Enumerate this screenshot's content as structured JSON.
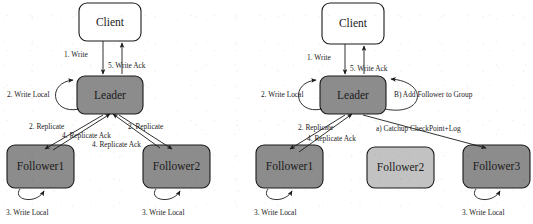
{
  "figure": {
    "background_color": "#ffffff",
    "line_color": "#1a1a1a",
    "text_color": "#1c1c1c",
    "colors": {
      "client_fill": "#ffffff",
      "leader_fill": "#8c8c8c",
      "follower_active_fill": "#8c8c8c",
      "follower_idle_fill": "#c2c2c2"
    }
  },
  "panels": [
    {
      "id": "left-panel",
      "name": "normal-replication-flow",
      "nodes": {
        "client": "Client",
        "leader": "Leader",
        "follower1": "Follower1",
        "follower2": "Follower2"
      },
      "edge_labels": {
        "write": "1. Write",
        "write_ack": "5. Write Ack",
        "leader_write_local": "2. Write Local",
        "replicate_left": "2. Replicate",
        "replicate_right": "2. Replicate",
        "replicate_ack_left": "4. Replicate Ack",
        "replicate_ack_right": "4. Replicate Ack",
        "follower1_write_local": "3. Write Local",
        "follower2_write_local": "3. Write Local"
      }
    },
    {
      "id": "right-panel",
      "name": "follower-catchup-and-join-flow",
      "nodes": {
        "client": "Client",
        "leader": "Leader",
        "follower1": "Follower1",
        "follower2": "Follower2",
        "follower3": "Follower3"
      },
      "edge_labels": {
        "write": "1. Write",
        "write_ack": "5. Write Ack",
        "leader_write_local": "2. Write Local",
        "add_follower_to_group": "B) Add Follower to Group",
        "replicate": "2. Replicate",
        "replicate_ack": "4. Replicate Ack",
        "catchup": "a) Catchup CheckPoint+Log",
        "follower1_write_local": "3. Write Local",
        "follower3_write_local": "3. Write Local"
      }
    }
  ]
}
